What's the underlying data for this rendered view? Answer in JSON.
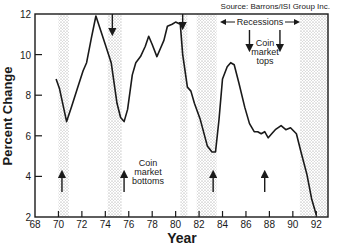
{
  "chart_data": {
    "type": "line",
    "title_fragment": "",
    "source": "Source: Barrons/ISI Group Inc.",
    "xlabel": "Year",
    "ylabel": "Percent Change",
    "xlim": [
      68,
      93
    ],
    "ylim": [
      2,
      12
    ],
    "xticks": [
      68,
      70,
      72,
      74,
      76,
      78,
      80,
      82,
      84,
      86,
      88,
      90,
      92
    ],
    "yticks": [
      2,
      4,
      6,
      8,
      10,
      12
    ],
    "grid": false,
    "series": [
      {
        "name": "Percent Change",
        "x": [
          69.8,
          70.1,
          70.4,
          70.7,
          71.1,
          71.6,
          72.1,
          72.4,
          72.8,
          73.2,
          73.6,
          74.0,
          74.5,
          75.0,
          75.3,
          75.6,
          75.9,
          76.3,
          76.6,
          77.0,
          77.4,
          77.7,
          78.0,
          78.4,
          78.7,
          79.0,
          79.3,
          79.7,
          80.0,
          80.4,
          80.6,
          81.0,
          81.3,
          81.6,
          82.1,
          82.7,
          83.1,
          83.4,
          83.7,
          84.0,
          84.4,
          84.7,
          85.0,
          85.4,
          85.9,
          86.3,
          86.7,
          87.0,
          87.3,
          87.6,
          87.9,
          88.2,
          88.5,
          89.0,
          89.4,
          89.8,
          90.3,
          90.7,
          91.2,
          91.6,
          92.0
        ],
        "y": [
          8.8,
          8.3,
          7.5,
          6.7,
          7.4,
          8.3,
          9.2,
          9.6,
          10.8,
          11.9,
          11.2,
          10.5,
          9.6,
          7.6,
          6.9,
          6.7,
          7.3,
          9.0,
          9.6,
          9.9,
          10.4,
          10.9,
          10.5,
          9.9,
          10.3,
          10.7,
          11.4,
          11.5,
          11.6,
          11.5,
          10.0,
          8.4,
          8.2,
          7.6,
          6.8,
          5.5,
          5.2,
          5.2,
          6.8,
          8.8,
          9.4,
          9.6,
          9.5,
          8.6,
          7.4,
          6.6,
          6.2,
          6.2,
          6.1,
          6.2,
          5.9,
          6.1,
          6.3,
          6.5,
          6.3,
          6.4,
          6.1,
          5.2,
          4.1,
          2.9,
          2.1
        ]
      }
    ],
    "recessions": [
      {
        "start": 70.0,
        "end": 70.9
      },
      {
        "start": 74.2,
        "end": 75.4
      },
      {
        "start": 80.4,
        "end": 81.0
      },
      {
        "start": 81.8,
        "end": 83.5
      },
      {
        "start": 90.6,
        "end": 93.0
      }
    ],
    "annotations": {
      "recessions_label": "Recessions",
      "tops_label": [
        "Coin",
        "market",
        "tops"
      ],
      "bottoms_label": [
        "Coin",
        "market",
        "bottoms"
      ],
      "tops_arrows_at_year": [
        74.6,
        80.6,
        86.3,
        88.9
      ],
      "bottoms_arrows_at_year": [
        70.3,
        75.6,
        83.2,
        87.6
      ]
    },
    "legend": "none"
  }
}
